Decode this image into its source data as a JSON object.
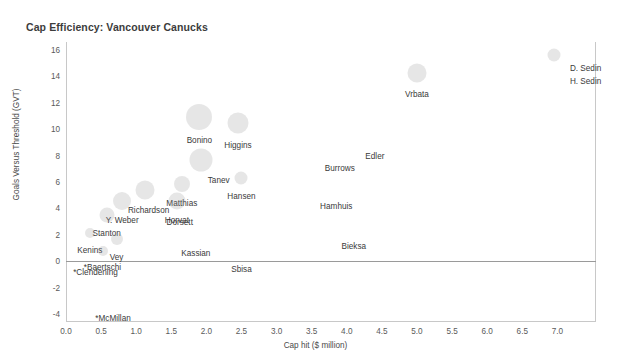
{
  "chart_data": {
    "type": "scatter",
    "title": "Cap Efficiency: Vancouver Canucks",
    "xlabel": "Cap hit ($ million)",
    "ylabel": "Goals Versus Threshold (GVT)",
    "xlim": [
      0.0,
      7.55
    ],
    "ylim": [
      -4.6,
      16.6
    ],
    "xticks": [
      "0.0",
      "0.5",
      "1.0",
      "1.5",
      "2.0",
      "2.5",
      "3.0",
      "3.5",
      "4.0",
      "4.5",
      "5.0",
      "5.5",
      "6.0",
      "6.5",
      "7.0"
    ],
    "xtick_values": [
      0.0,
      0.5,
      1.0,
      1.5,
      2.0,
      2.5,
      3.0,
      3.5,
      4.0,
      4.5,
      5.0,
      5.5,
      6.0,
      6.5,
      7.0
    ],
    "yticks": [
      "16",
      "14",
      "12",
      "10",
      "8",
      "6",
      "4",
      "2",
      "0",
      "-2",
      "-4"
    ],
    "ytick_values": [
      16,
      14,
      12,
      10,
      8,
      6,
      4,
      2,
      0,
      -2,
      -4
    ],
    "grid": false,
    "legend": "none",
    "zero_reference_line": 0,
    "bubble_color": "#8c8c8c",
    "points": [
      {
        "label": "D. Sedin",
        "x": 6.95,
        "y": 15.65,
        "size": 13,
        "label_dx": 16,
        "label_dy": 10,
        "label_anchor": "start"
      },
      {
        "label": "H. Sedin",
        "x": 6.95,
        "y": 14.6,
        "size": 0,
        "label_dx": 16,
        "label_dy": 10,
        "label_anchor": "start"
      },
      {
        "label": "Vrbata",
        "x": 5.0,
        "y": 14.25,
        "size": 19,
        "label_dx": 0,
        "label_dy": 18,
        "label_anchor": "middle"
      },
      {
        "label": "Bonino",
        "x": 1.9,
        "y": 10.9,
        "size": 26,
        "label_dx": 0,
        "label_dy": 20,
        "label_anchor": "middle"
      },
      {
        "label": "Higgins",
        "x": 2.45,
        "y": 10.45,
        "size": 21,
        "label_dx": 0,
        "label_dy": 19,
        "label_anchor": "middle"
      },
      {
        "label": "Edler",
        "x": 4.4,
        "y": 8.2,
        "size": 0,
        "label_dx": 0,
        "label_dy": 0,
        "label_anchor": "middle"
      },
      {
        "label": "Burrows",
        "x": 3.9,
        "y": 7.3,
        "size": 0,
        "label_dx": 0,
        "label_dy": 0,
        "label_anchor": "middle"
      },
      {
        "label": "Tanev",
        "x": 1.92,
        "y": 7.7,
        "size": 23,
        "label_dx": 7,
        "label_dy": 17,
        "label_anchor": "start"
      },
      {
        "label": "Hansen",
        "x": 2.5,
        "y": 6.3,
        "size": 13,
        "label_dx": 0,
        "label_dy": 15,
        "label_anchor": "middle"
      },
      {
        "label": "Matthias",
        "x": 1.65,
        "y": 5.85,
        "size": 16,
        "label_dx": 0,
        "label_dy": 16,
        "label_anchor": "middle"
      },
      {
        "label": "Hamhuis",
        "x": 3.85,
        "y": 4.4,
        "size": 0,
        "label_dx": 0,
        "label_dy": 0,
        "label_anchor": "middle"
      },
      {
        "label": "Richardson",
        "x": 1.12,
        "y": 5.4,
        "size": 19,
        "label_dx": 4,
        "label_dy": 17,
        "label_anchor": "middle"
      },
      {
        "label": "Horvat",
        "x": 1.58,
        "y": 4.55,
        "size": 17,
        "label_dx": 0,
        "label_dy": 16,
        "label_anchor": "middle"
      },
      {
        "label": "Y. Weber",
        "x": 0.8,
        "y": 4.55,
        "size": 18,
        "label_dx": 0,
        "label_dy": 16,
        "label_anchor": "middle"
      },
      {
        "label": "Dorsett",
        "x": 1.62,
        "y": 3.2,
        "size": 0,
        "label_dx": 0,
        "label_dy": 0,
        "label_anchor": "middle"
      },
      {
        "label": "Stanton",
        "x": 0.58,
        "y": 3.5,
        "size": 15,
        "label_dx": 0,
        "label_dy": 15,
        "label_anchor": "middle"
      },
      {
        "label": "Bieksa",
        "x": 4.1,
        "y": 1.35,
        "size": 0,
        "label_dx": 0,
        "label_dy": 0,
        "label_anchor": "middle"
      },
      {
        "label": "Kenins",
        "x": 0.34,
        "y": 2.15,
        "size": 10,
        "label_dx": 0,
        "label_dy": 14,
        "label_anchor": "middle"
      },
      {
        "label": "Vey",
        "x": 0.72,
        "y": 1.65,
        "size": 12,
        "label_dx": 0,
        "label_dy": 15,
        "label_anchor": "middle"
      },
      {
        "label": "Kassian",
        "x": 1.85,
        "y": 0.85,
        "size": 0,
        "label_dx": 0,
        "label_dy": 0,
        "label_anchor": "middle"
      },
      {
        "label": "*Baertschi",
        "x": 0.52,
        "y": 0.8,
        "size": 10,
        "label_dx": 0,
        "label_dy": 13,
        "label_anchor": "middle"
      },
      {
        "label": "Sbisa",
        "x": 2.5,
        "y": -0.35,
        "size": 0,
        "label_dx": 0,
        "label_dy": 0,
        "label_anchor": "middle"
      },
      {
        "label": "*Clendening",
        "x": 0.42,
        "y": -0.55,
        "size": 0,
        "label_dx": 0,
        "label_dy": 0,
        "label_anchor": "middle"
      },
      {
        "label": "*McMillan",
        "x": 0.67,
        "y": -4.05,
        "size": 0,
        "label_dx": 0,
        "label_dy": 0,
        "label_anchor": "middle"
      }
    ]
  }
}
